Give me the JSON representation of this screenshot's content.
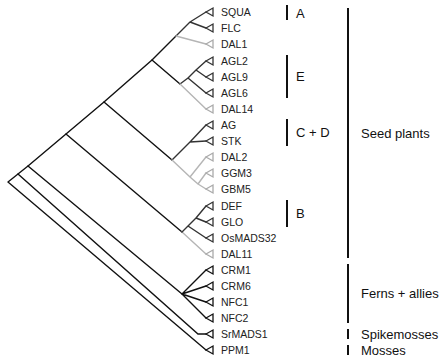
{
  "tree": {
    "tips": [
      {
        "label": "SQUA",
        "y": 12,
        "color": "#333333"
      },
      {
        "label": "FLC",
        "y": 28,
        "color": "#333333"
      },
      {
        "label": "DAL1",
        "y": 44,
        "color": "#aaaaaa"
      },
      {
        "label": "AGL2",
        "y": 61,
        "color": "#333333"
      },
      {
        "label": "AGL9",
        "y": 77,
        "color": "#333333"
      },
      {
        "label": "AGL6",
        "y": 93,
        "color": "#333333"
      },
      {
        "label": "DAL14",
        "y": 109,
        "color": "#aaaaaa"
      },
      {
        "label": "AG",
        "y": 125,
        "color": "#333333"
      },
      {
        "label": "STK",
        "y": 141,
        "color": "#333333"
      },
      {
        "label": "DAL2",
        "y": 157,
        "color": "#aaaaaa"
      },
      {
        "label": "GGM3",
        "y": 173,
        "color": "#aaaaaa"
      },
      {
        "label": "GBM5",
        "y": 189,
        "color": "#aaaaaa"
      },
      {
        "label": "DEF",
        "y": 206,
        "color": "#333333"
      },
      {
        "label": "GLO",
        "y": 222,
        "color": "#333333"
      },
      {
        "label": "OsMADS32",
        "y": 238,
        "color": "#333333"
      },
      {
        "label": "DAL11",
        "y": 254,
        "color": "#aaaaaa"
      },
      {
        "label": "CRM1",
        "y": 270,
        "color": "#111111"
      },
      {
        "label": "CRM6",
        "y": 286,
        "color": "#111111"
      },
      {
        "label": "NFC1",
        "y": 302,
        "color": "#111111"
      },
      {
        "label": "NFC2",
        "y": 318,
        "color": "#111111"
      },
      {
        "label": "SrMADS1",
        "y": 334,
        "color": "#111111"
      },
      {
        "label": "PPM1",
        "y": 350,
        "color": "#111111"
      }
    ],
    "tip_x": 206,
    "label_x": 221
  },
  "clades": [
    {
      "label": "A",
      "bar_x": 286,
      "y1": 5,
      "y2": 20,
      "label_y": 6
    },
    {
      "label": "E",
      "bar_x": 286,
      "y1": 55,
      "y2": 98,
      "label_y": 69
    },
    {
      "label": "C + D",
      "bar_x": 286,
      "y1": 119,
      "y2": 146,
      "label_y": 125
    },
    {
      "label": "B",
      "bar_x": 286,
      "y1": 200,
      "y2": 227,
      "label_y": 206
    }
  ],
  "groups": [
    {
      "label": "Seed plants",
      "bar_x": 347,
      "y1": 8,
      "y2": 258,
      "label_y": 126
    },
    {
      "label": "Ferns + allies",
      "bar_x": 347,
      "y1": 264,
      "y2": 323,
      "label_y": 286
    },
    {
      "label": "Spikemosses",
      "bar_x": 347,
      "y1": 329,
      "y2": 339,
      "label_y": 327
    },
    {
      "label": "Mosses",
      "bar_x": 347,
      "y1": 345,
      "y2": 355,
      "label_y": 343
    }
  ],
  "colors": {
    "branch_dark": "#111111",
    "branch_mid": "#444444",
    "branch_light": "#b5b5b5"
  }
}
